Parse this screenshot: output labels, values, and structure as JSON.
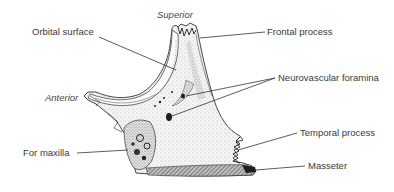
{
  "figure": {
    "colors": {
      "line": "#333333",
      "text": "#3a3a3a",
      "bone_fill": "#f1f1f1",
      "stipple": "#9a9a9a",
      "hatch": "#555555",
      "foramen": "#1e1e1e"
    },
    "orientation_labels": {
      "superior": "Superior",
      "anterior": "Anterior"
    },
    "labels": [
      {
        "id": "orbital-surface",
        "text": "Orbital surface"
      },
      {
        "id": "frontal-process",
        "text": "Frontal process"
      },
      {
        "id": "neurovascular-foramina",
        "text": "Neurovascular foramina"
      },
      {
        "id": "for-maxilla",
        "text": "For maxilla"
      },
      {
        "id": "temporal-process",
        "text": "Temporal process"
      },
      {
        "id": "masseter",
        "text": "Masseter"
      }
    ]
  }
}
